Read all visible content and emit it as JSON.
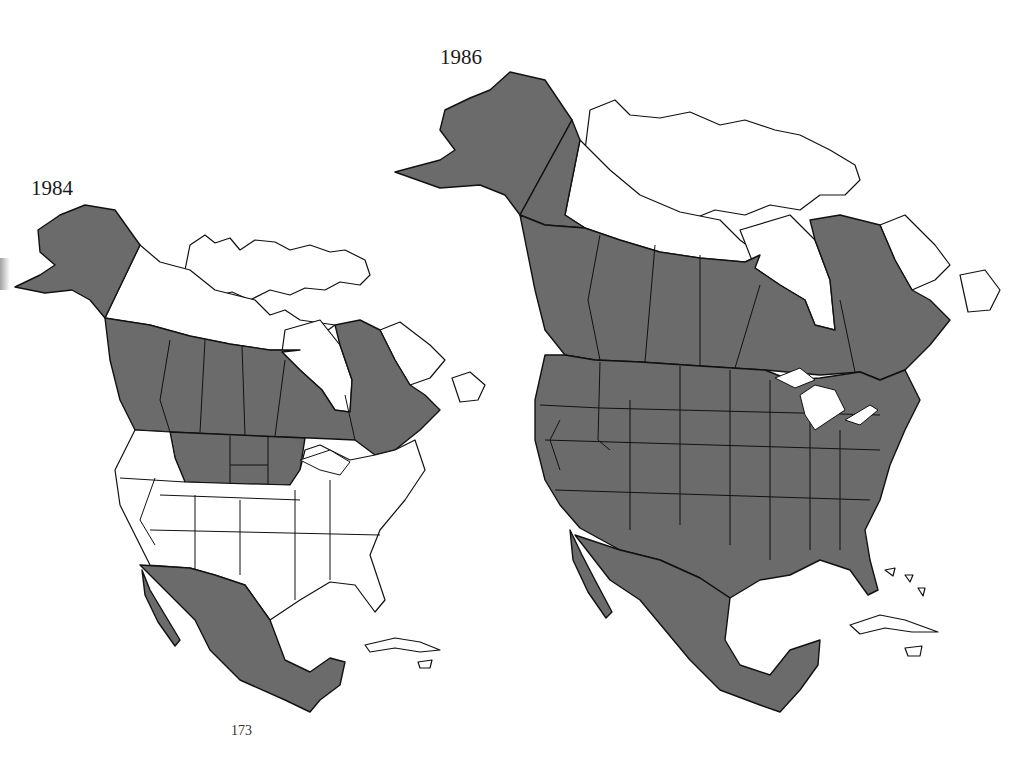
{
  "maps": [
    {
      "year": "1984",
      "shaded_regions": [
        "Alaska",
        "British Columbia",
        "Alberta",
        "Saskatchewan",
        "Manitoba",
        "Ontario",
        "Quebec",
        "New Brunswick",
        "Nova Scotia",
        "Montana",
        "North Dakota",
        "South Dakota",
        "Minnesota",
        "Mexico"
      ],
      "unshaded_regions": [
        "Yukon",
        "Northwest Territories",
        "Arctic Islands",
        "Labrador",
        "Newfoundland",
        "Washington",
        "Oregon",
        "Idaho",
        "Wyoming",
        "California",
        "Nevada",
        "Utah",
        "Colorado",
        "Arizona",
        "New Mexico",
        "Texas",
        "Eastern United States",
        "Cuba",
        "Caribbean"
      ]
    },
    {
      "year": "1986",
      "shaded_regions": [
        "Alaska",
        "Yukon",
        "British Columbia",
        "Alberta",
        "Saskatchewan",
        "Manitoba",
        "Ontario",
        "Quebec",
        "New Brunswick",
        "Nova Scotia",
        "Continental United States",
        "Mexico"
      ],
      "unshaded_regions": [
        "Northwest Territories",
        "Arctic Islands",
        "Labrador",
        "Newfoundland",
        "Cuba",
        "Caribbean"
      ]
    }
  ],
  "legend": {
    "shaded": "#6b6b6b",
    "unshaded": "#ffffff"
  },
  "page_number": "173"
}
